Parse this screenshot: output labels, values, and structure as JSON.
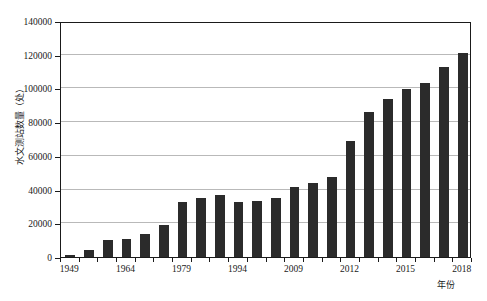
{
  "chart_data": {
    "type": "bar",
    "title": "",
    "xlabel": "年份",
    "ylabel": "水文测站数量（处）",
    "ylim": [
      0,
      140000
    ],
    "ytick_values": [
      0,
      20000,
      40000,
      60000,
      80000,
      100000,
      120000,
      140000
    ],
    "ytick_labels": [
      "0",
      "20000",
      "40000",
      "60000",
      "80000",
      "100000",
      "120000",
      "140000"
    ],
    "grid": true,
    "legend": "none",
    "bar_color": "#2b2b2b",
    "categories": [
      "1949",
      "1954",
      "1959",
      "1964",
      "1969",
      "1974",
      "1979",
      "1984",
      "1989",
      "1994",
      "1999",
      "2004",
      "2009",
      "2010",
      "2011",
      "2012",
      "2013",
      "2014",
      "2015",
      "2016",
      "2017",
      "2018"
    ],
    "values": [
      1000,
      4200,
      10200,
      10800,
      13500,
      19000,
      32500,
      35000,
      37000,
      32500,
      33500,
      34800,
      41500,
      44000,
      47500,
      69000,
      86000,
      93500,
      99500,
      103000,
      112500,
      121000
    ],
    "xtick_labels": [
      "1949",
      "1964",
      "1979",
      "1994",
      "2009",
      "2012",
      "2015",
      "2018"
    ],
    "xtick_category_index": [
      0,
      3,
      6,
      9,
      12,
      15,
      18,
      21
    ]
  },
  "axes": {
    "y_title": "水文测站数量（处）",
    "x_title": "年份"
  }
}
